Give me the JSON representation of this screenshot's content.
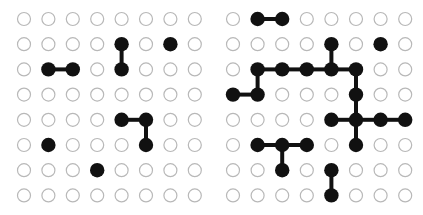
{
  "figure": {
    "grids": [
      {
        "name": "left-grid",
        "rows": 8,
        "cols": 8,
        "filled_nodes": [
          [
            1,
            4
          ],
          [
            2,
            4
          ],
          [
            1,
            6
          ],
          [
            2,
            1
          ],
          [
            2,
            2
          ],
          [
            4,
            4
          ],
          [
            4,
            5
          ],
          [
            5,
            5
          ],
          [
            5,
            1
          ],
          [
            6,
            3
          ]
        ],
        "edges": [
          [
            [
              1,
              4
            ],
            [
              2,
              4
            ]
          ],
          [
            [
              2,
              1
            ],
            [
              2,
              2
            ]
          ],
          [
            [
              4,
              4
            ],
            [
              4,
              5
            ]
          ],
          [
            [
              4,
              5
            ],
            [
              5,
              5
            ]
          ]
        ]
      },
      {
        "name": "right-grid",
        "rows": 8,
        "cols": 8,
        "filled_nodes": [
          [
            0,
            1
          ],
          [
            0,
            2
          ],
          [
            1,
            4
          ],
          [
            1,
            6
          ],
          [
            2,
            1
          ],
          [
            2,
            2
          ],
          [
            2,
            3
          ],
          [
            2,
            4
          ],
          [
            2,
            5
          ],
          [
            3,
            0
          ],
          [
            3,
            1
          ],
          [
            3,
            5
          ],
          [
            4,
            4
          ],
          [
            4,
            5
          ],
          [
            4,
            6
          ],
          [
            4,
            7
          ],
          [
            5,
            1
          ],
          [
            5,
            2
          ],
          [
            5,
            3
          ],
          [
            5,
            5
          ],
          [
            6,
            2
          ],
          [
            6,
            4
          ],
          [
            7,
            4
          ]
        ],
        "edges": [
          [
            [
              0,
              1
            ],
            [
              0,
              2
            ]
          ],
          [
            [
              1,
              4
            ],
            [
              2,
              4
            ]
          ],
          [
            [
              2,
              1
            ],
            [
              2,
              2
            ]
          ],
          [
            [
              2,
              2
            ],
            [
              2,
              3
            ]
          ],
          [
            [
              2,
              3
            ],
            [
              2,
              4
            ]
          ],
          [
            [
              2,
              4
            ],
            [
              2,
              5
            ]
          ],
          [
            [
              2,
              1
            ],
            [
              3,
              1
            ]
          ],
          [
            [
              3,
              0
            ],
            [
              3,
              1
            ]
          ],
          [
            [
              2,
              5
            ],
            [
              3,
              5
            ]
          ],
          [
            [
              3,
              5
            ],
            [
              4,
              5
            ]
          ],
          [
            [
              4,
              4
            ],
            [
              4,
              5
            ]
          ],
          [
            [
              4,
              5
            ],
            [
              4,
              6
            ]
          ],
          [
            [
              4,
              6
            ],
            [
              4,
              7
            ]
          ],
          [
            [
              4,
              5
            ],
            [
              5,
              5
            ]
          ],
          [
            [
              5,
              1
            ],
            [
              5,
              2
            ]
          ],
          [
            [
              5,
              2
            ],
            [
              5,
              3
            ]
          ],
          [
            [
              5,
              2
            ],
            [
              6,
              2
            ]
          ],
          [
            [
              6,
              4
            ],
            [
              7,
              4
            ]
          ]
        ]
      }
    ],
    "colors": {
      "filled": "#111111",
      "empty_stroke": "#b8b8b8",
      "edge": "#111111"
    }
  }
}
